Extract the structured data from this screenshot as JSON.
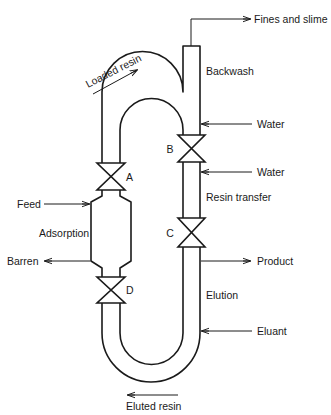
{
  "diagram": {
    "type": "process-flow",
    "streams": {
      "fines": "Fines and slime",
      "water_top": "Water",
      "water_mid": "Water",
      "feed": "Feed",
      "barren": "Barren",
      "product": "Product",
      "eluant": "Eluant",
      "loaded_resin": "Loaded resin",
      "eluted_resin": "Eluted resin"
    },
    "sections": {
      "backwash": "Backwash",
      "resin_transfer": "Resin transfer",
      "adsorption": "Adsorption",
      "elution": "Elution"
    },
    "valves": {
      "a": "A",
      "b": "B",
      "c": "C",
      "d": "D"
    },
    "colors": {
      "line": "#1a1a1a",
      "background": "#ffffff"
    }
  }
}
